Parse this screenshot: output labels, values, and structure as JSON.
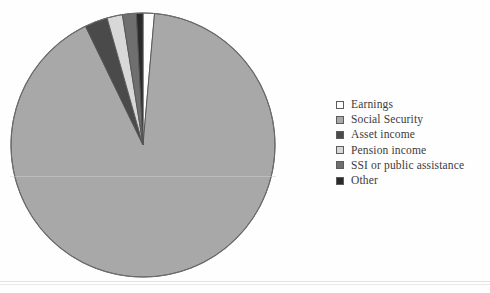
{
  "chart_data": {
    "type": "pie",
    "title": "",
    "subtitle": "",
    "xlabel": "",
    "ylabel": "",
    "legend_position": "right",
    "grid": false,
    "start_angle_deg": 0,
    "direction": "clockwise",
    "categories": [
      "Earnings",
      "Social Security",
      "Asset income",
      "Pension income",
      "SSI or public assistance",
      "Other"
    ],
    "values": [
      1.4,
      91.7,
      2.8,
      1.9,
      1.7,
      0.8
    ],
    "value_unit": "percent",
    "slice_colors": [
      "#fdfdfd",
      "#a8a8a8",
      "#4a4a4a",
      "#d8d8d8",
      "#6f6f6f",
      "#2a2a2a"
    ],
    "slice_order_clockwise_from_top": [
      "Earnings",
      "Social Security",
      "Asset income",
      "Pension income",
      "SSI or public assistance",
      "Other"
    ],
    "slice_edge_color": "#555555",
    "background_color": "#fefefe"
  },
  "chart": {
    "outline_color": "#6b6b6b",
    "center_x": 134,
    "center_y": 134,
    "radius": 132
  },
  "legend": {
    "items": [
      {
        "label": "Earnings",
        "swatch": "#fdfdfd",
        "swatch_name": "legend-swatch-earnings"
      },
      {
        "label": "Social Security",
        "swatch": "#a8a8a8",
        "swatch_name": "legend-swatch-social-security"
      },
      {
        "label": "Asset income",
        "swatch": "#4a4a4a",
        "swatch_name": "legend-swatch-asset-income"
      },
      {
        "label": "Pension income",
        "swatch": "#d8d8d8",
        "swatch_name": "legend-swatch-pension-income"
      },
      {
        "label": "SSI or public assistance",
        "swatch": "#6f6f6f",
        "swatch_name": "legend-swatch-ssi"
      },
      {
        "label": "Other",
        "swatch": "#2a2a2a",
        "swatch_name": "legend-swatch-other"
      }
    ]
  }
}
